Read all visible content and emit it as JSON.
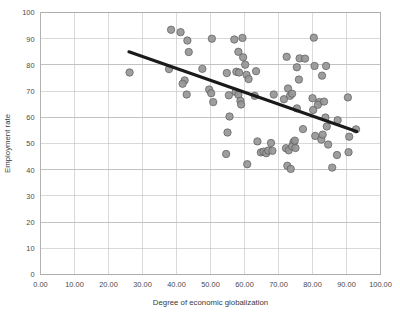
{
  "chart_data": {
    "type": "scatter",
    "title": "",
    "xlabel": "Degree of economic globalization",
    "ylabel": "Employment rate",
    "xlim": [
      0,
      100
    ],
    "ylim": [
      0,
      100
    ],
    "grid": true,
    "legend": "none",
    "xticks": [
      0,
      10,
      20,
      30,
      40,
      50,
      60,
      70,
      80,
      90,
      100
    ],
    "xtick_labels": [
      "0.00",
      "10.00",
      "20.00",
      "30.00",
      "40.00",
      "50.00",
      "60.00",
      "70.00",
      "80.00",
      "90.00",
      "100.00"
    ],
    "yticks": [
      0,
      10,
      20,
      30,
      40,
      50,
      60,
      70,
      80,
      90,
      100
    ],
    "ytick_labels": [
      "0",
      "10",
      "20",
      "30",
      "40",
      "50",
      "60",
      "70",
      "80",
      "90",
      "100"
    ],
    "marker": {
      "shape": "circle",
      "fill_color": "#969696",
      "edge_color": "#5a5a5a",
      "size_px": 5.2
    },
    "trendline": {
      "type": "linear",
      "color": "#1a1a1a",
      "width_px": 3.1,
      "x_start": 26.0,
      "y_start": 85.0,
      "x_end": 93.0,
      "y_end": 54.6
    },
    "points": [
      [
        26.2,
        77.1
      ],
      [
        38.4,
        93.4
      ],
      [
        37.8,
        78.4
      ],
      [
        41.2,
        92.5
      ],
      [
        43.2,
        89.3
      ],
      [
        43.6,
        84.9
      ],
      [
        42.4,
        74.1
      ],
      [
        41.8,
        72.8
      ],
      [
        43.0,
        68.7
      ],
      [
        47.6,
        78.5
      ],
      [
        50.4,
        90.0
      ],
      [
        49.6,
        70.6
      ],
      [
        50.2,
        69.2
      ],
      [
        50.8,
        65.8
      ],
      [
        54.8,
        76.9
      ],
      [
        55.4,
        68.4
      ],
      [
        55.6,
        60.3
      ],
      [
        55.0,
        54.2
      ],
      [
        54.6,
        46.0
      ],
      [
        57.0,
        89.7
      ],
      [
        58.2,
        85.0
      ],
      [
        59.4,
        90.3
      ],
      [
        57.6,
        77.4
      ],
      [
        58.4,
        77.1
      ],
      [
        59.6,
        82.9
      ],
      [
        60.2,
        80.1
      ],
      [
        57.4,
        69.7
      ],
      [
        58.2,
        68.6
      ],
      [
        58.8,
        66.3
      ],
      [
        59.0,
        64.9
      ],
      [
        60.6,
        76.2
      ],
      [
        61.2,
        74.6
      ],
      [
        60.8,
        42.1
      ],
      [
        63.4,
        77.6
      ],
      [
        63.0,
        68.2
      ],
      [
        63.8,
        50.8
      ],
      [
        64.8,
        46.6
      ],
      [
        65.6,
        46.9
      ],
      [
        66.4,
        46.3
      ],
      [
        67.8,
        50.2
      ],
      [
        67.0,
        47.3
      ],
      [
        68.2,
        47.2
      ],
      [
        68.6,
        68.7
      ],
      [
        72.4,
        83.1
      ],
      [
        71.6,
        66.9
      ],
      [
        72.8,
        71.0
      ],
      [
        73.4,
        68.2
      ],
      [
        74.0,
        69.0
      ],
      [
        72.2,
        48.2
      ],
      [
        73.0,
        47.4
      ],
      [
        72.6,
        41.5
      ],
      [
        73.6,
        40.3
      ],
      [
        74.4,
        50.5
      ],
      [
        74.0,
        48.9
      ],
      [
        75.0,
        48.3
      ],
      [
        74.8,
        51.1
      ],
      [
        75.4,
        63.4
      ],
      [
        76.0,
        74.4
      ],
      [
        76.2,
        82.5
      ],
      [
        75.4,
        79.1
      ],
      [
        77.8,
        82.4
      ],
      [
        77.2,
        55.5
      ],
      [
        80.4,
        90.4
      ],
      [
        80.6,
        79.6
      ],
      [
        80.0,
        67.3
      ],
      [
        80.2,
        62.8
      ],
      [
        80.8,
        52.9
      ],
      [
        82.0,
        65.8
      ],
      [
        81.6,
        64.8
      ],
      [
        82.6,
        51.5
      ],
      [
        83.0,
        53.4
      ],
      [
        83.4,
        66.0
      ],
      [
        82.8,
        75.9
      ],
      [
        84.0,
        79.6
      ],
      [
        83.8,
        59.9
      ],
      [
        84.2,
        56.5
      ],
      [
        84.6,
        49.6
      ],
      [
        85.8,
        40.8
      ],
      [
        87.4,
        58.9
      ],
      [
        87.2,
        45.6
      ],
      [
        90.4,
        67.6
      ],
      [
        90.8,
        52.6
      ],
      [
        90.6,
        46.7
      ],
      [
        92.8,
        55.4
      ]
    ]
  },
  "axes": {
    "x_title": "Degree of economic globalization",
    "y_title": "Employment rate"
  }
}
